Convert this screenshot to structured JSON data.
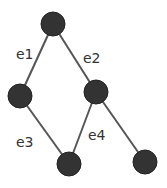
{
  "diagram": {
    "type": "graph",
    "nodes": [
      {
        "id": "n1",
        "x": 53,
        "y": 24
      },
      {
        "id": "n2",
        "x": 20,
        "y": 96
      },
      {
        "id": "n3",
        "x": 96,
        "y": 92
      },
      {
        "id": "n4",
        "x": 69,
        "y": 164
      },
      {
        "id": "n5",
        "x": 145,
        "y": 162
      }
    ],
    "edges": [
      {
        "label": "e1",
        "from": "n1",
        "to": "n2",
        "label_x": 16,
        "label_y": 59
      },
      {
        "label": "e2",
        "from": "n1",
        "to": "n3",
        "label_x": 83,
        "label_y": 63
      },
      {
        "label": "e3",
        "from": "n2",
        "to": "n4",
        "label_x": 16,
        "label_y": 147
      },
      {
        "label": "e4",
        "from": "n3",
        "to": "n4",
        "label_x": 88,
        "label_y": 140
      },
      {
        "label": "",
        "from": "n3",
        "to": "n5"
      }
    ],
    "node_radius": 12,
    "colors": {
      "node": "#333333",
      "edge": "#555555",
      "text": "#333333"
    }
  }
}
